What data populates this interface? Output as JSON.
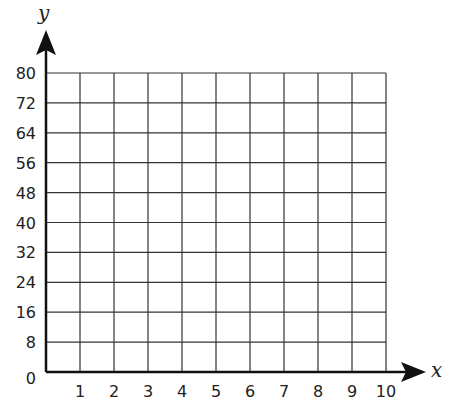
{
  "chart_data": {
    "type": "scatter",
    "title": "",
    "xlabel": "x",
    "ylabel": "y",
    "xlim": [
      0,
      10
    ],
    "ylim": [
      0,
      80
    ],
    "x_ticks": [
      "1",
      "2",
      "3",
      "4",
      "5",
      "6",
      "7",
      "8",
      "9",
      "10"
    ],
    "y_ticks": [
      "0",
      "8",
      "16",
      "24",
      "32",
      "40",
      "48",
      "56",
      "64",
      "72",
      "80"
    ],
    "grid": true,
    "series": []
  },
  "colors": {
    "grid": "#333333",
    "axis": "#111111",
    "text": "#222222"
  }
}
